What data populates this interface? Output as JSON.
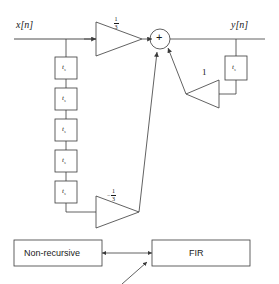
{
  "figure": {
    "type": "signal-flow-block-diagram",
    "background": "#ffffff",
    "stroke": "#3a3a3a"
  },
  "signals": {
    "input_label": "x[n]",
    "output_label": "y[n]"
  },
  "delay_chain": {
    "block_label_base": "t",
    "block_label_sub": "s",
    "count": 5
  },
  "feedback_delay": {
    "block_label_base": "t",
    "block_label_sub": "s"
  },
  "gains": {
    "forward": {
      "numerator": "1",
      "denominator": "3",
      "sign": ""
    },
    "delayed": {
      "numerator": "1",
      "denominator": "3",
      "sign": "−"
    },
    "feedback": {
      "value": "1"
    }
  },
  "adder": {
    "symbol": "+"
  },
  "annotations": {
    "left_box": "Non-recursive",
    "right_box": "FIR"
  }
}
